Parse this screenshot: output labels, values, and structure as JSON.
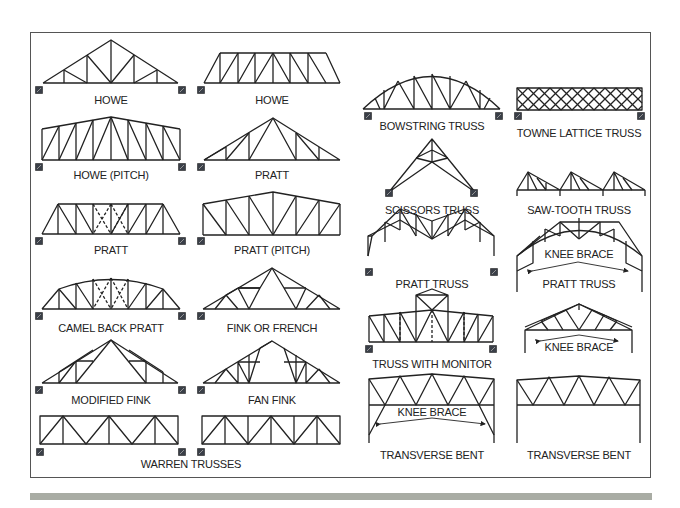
{
  "labels": {
    "howe_a": "HOWE",
    "howe_b": "HOWE",
    "howe_pitch": "HOWE (PITCH)",
    "pratt_a": "PRATT",
    "pratt_b": "PRATT",
    "pratt_pitch": "PRATT (PITCH)",
    "camel_back_pratt": "CAMEL BACK PRATT",
    "fink_or_french": "FINK OR FRENCH",
    "modified_fink": "MODIFIED FINK",
    "fan_fink": "FAN FINK",
    "warren_trusses": "WARREN TRUSSES",
    "bowstring_truss": "BOWSTRING TRUSS",
    "towne_lattice_truss": "TOWNE LATTICE TRUSS",
    "scissors_truss": "SCISSORS TRUSS",
    "saw_tooth_truss": "SAW-TOOTH TRUSS",
    "pratt_truss_a": "PRATT TRUSS",
    "pratt_truss_b": "PRATT TRUSS",
    "knee_brace_a": "KNEE BRACE",
    "knee_brace_b": "KNEE BRACE",
    "knee_brace_c": "KNEE BRACE",
    "truss_with_monitor": "TRUSS WITH MONITOR",
    "transverse_bent_a": "TRANSVERSE BENT",
    "transverse_bent_b": "TRANSVERSE BENT"
  },
  "colors": {
    "line": "#222222",
    "frame": "#555555",
    "footer_bar": "#a9aca4",
    "support": "#3a3f48"
  }
}
